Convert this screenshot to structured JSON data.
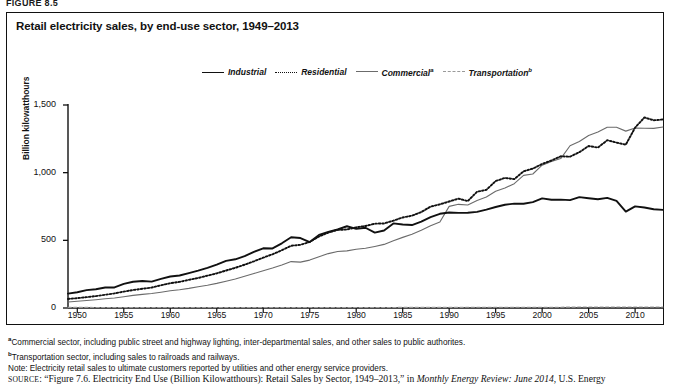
{
  "figure": {
    "number": "FIGURE 8.5",
    "title": "Retail electricity sales, by end-use sector, 1949–2013"
  },
  "axis": {
    "y_label": "Billion kilowatthours",
    "y_ticks": [
      "0",
      "500",
      "1,000",
      "1,500"
    ],
    "x_ticks": [
      "1950",
      "1955",
      "1960",
      "1965",
      "1970",
      "1975",
      "1980",
      "1985",
      "1990",
      "1995",
      "2000",
      "2005",
      "2010"
    ]
  },
  "legend": {
    "items": [
      {
        "label": "Industrial",
        "style": "solid-bold",
        "color": "#111111",
        "sup": ""
      },
      {
        "label": "Residential",
        "style": "dotted",
        "color": "#111111",
        "sup": ""
      },
      {
        "label": "Commercial",
        "style": "solid-thin",
        "color": "#6b6b6b",
        "sup": "a"
      },
      {
        "label": "Transportation",
        "style": "dashed",
        "color": "#9a9a9a",
        "sup": "b"
      }
    ]
  },
  "notes": {
    "footnote_a_marker": "a",
    "footnote_a": "Commercial sector, including public street and highway lighting, inter-departmental sales, and other sales to public authorites.",
    "footnote_b_marker": "b",
    "footnote_b": "Transportation sector, including sales to railroads and railways.",
    "note": "Note: Electricity retail sales to ultimate customers reported by utilities and other energy service providers."
  },
  "source": {
    "prefix": "SOURCE",
    "text_1": ": “Figure 7.6. Electricity End Use (Billion Kilowatthours): Retail Sales by Sector, 1949–2013,” in ",
    "italic": "Monthly Energy Review: June 2014",
    "text_2": ", U.S. Energy"
  },
  "chart_data": {
    "type": "line",
    "title": "Retail electricity sales, by end-use sector, 1949–2013",
    "xlabel": "",
    "ylabel": "Billion kilowatthours",
    "xlim": [
      1949,
      2013
    ],
    "ylim": [
      0,
      1500
    ],
    "grid": false,
    "legend_position": "top-center",
    "x": [
      1949,
      1950,
      1951,
      1952,
      1953,
      1954,
      1955,
      1956,
      1957,
      1958,
      1959,
      1960,
      1961,
      1962,
      1963,
      1964,
      1965,
      1966,
      1967,
      1968,
      1969,
      1970,
      1971,
      1972,
      1973,
      1974,
      1975,
      1976,
      1977,
      1978,
      1979,
      1980,
      1981,
      1982,
      1983,
      1984,
      1985,
      1986,
      1987,
      1988,
      1989,
      1990,
      1991,
      1992,
      1993,
      1994,
      1995,
      1996,
      1997,
      1998,
      1999,
      2000,
      2001,
      2002,
      2003,
      2004,
      2005,
      2006,
      2007,
      2008,
      2009,
      2010,
      2011,
      2012,
      2013
    ],
    "series": [
      {
        "name": "Industrial",
        "style": "solid-bold",
        "color": "#111111",
        "values": [
          106,
          116,
          132,
          139,
          151,
          152,
          178,
          194,
          200,
          195,
          215,
          233,
          240,
          258,
          276,
          297,
          320,
          348,
          360,
          383,
          415,
          441,
          440,
          478,
          523,
          517,
          487,
          540,
          562,
          580,
          604,
          585,
          593,
          557,
          573,
          625,
          617,
          613,
          638,
          672,
          696,
          706,
          703,
          704,
          710,
          727,
          746,
          763,
          771,
          770,
          782,
          810,
          800,
          801,
          797,
          819,
          811,
          804,
          814,
          792,
          712,
          751,
          743,
          730,
          725
        ]
      },
      {
        "name": "Residential",
        "style": "dotted",
        "color": "#111111",
        "values": [
          67,
          73,
          80,
          88,
          98,
          108,
          121,
          133,
          142,
          151,
          168,
          183,
          193,
          208,
          222,
          239,
          256,
          277,
          297,
          320,
          345,
          372,
          397,
          427,
          460,
          467,
          488,
          528,
          557,
          577,
          580,
          596,
          606,
          623,
          625,
          645,
          669,
          682,
          709,
          749,
          766,
          787,
          808,
          790,
          859,
          873,
          938,
          961,
          952,
          1010,
          1030,
          1064,
          1090,
          1121,
          1118,
          1151,
          1197,
          1185,
          1240,
          1222,
          1207,
          1333,
          1408,
          1387,
          1393
        ]
      },
      {
        "name": "Commercial",
        "style": "solid-thin",
        "color": "#6b6b6b",
        "values": [
          44,
          50,
          55,
          61,
          68,
          74,
          83,
          93,
          101,
          107,
          117,
          128,
          135,
          145,
          157,
          168,
          182,
          198,
          214,
          234,
          255,
          275,
          295,
          318,
          343,
          339,
          354,
          379,
          402,
          417,
          422,
          434,
          441,
          455,
          470,
          497,
          522,
          545,
          574,
          608,
          635,
          751,
          766,
          761,
          795,
          820,
          863,
          886,
          919,
          980,
          990,
          1055,
          1083,
          1104,
          1199,
          1230,
          1275,
          1300,
          1336,
          1336,
          1307,
          1330,
          1328,
          1327,
          1337
        ]
      },
      {
        "name": "Transportation",
        "style": "dashed",
        "color": "#9a9a9a",
        "values": [
          4.5,
          4.3,
          4.3,
          4.2,
          4.1,
          4.0,
          4.0,
          4.0,
          3.9,
          3.8,
          3.8,
          3.8,
          3.8,
          3.8,
          3.8,
          3.8,
          3.8,
          3.8,
          3.8,
          3.8,
          3.8,
          3.9,
          3.9,
          3.9,
          3.9,
          3.9,
          3.9,
          4.0,
          4.0,
          4.0,
          4.0,
          4.0,
          4.1,
          4.1,
          4.1,
          4.2,
          4.3,
          4.4,
          4.5,
          4.6,
          4.7,
          4.8,
          4.9,
          5.0,
          5.1,
          5.2,
          5.3,
          5.4,
          5.5,
          5.6,
          5.7,
          5.8,
          5.9,
          6.0,
          6.5,
          7.0,
          7.5,
          7.6,
          7.7,
          7.8,
          7.5,
          7.7,
          7.5,
          7.3,
          7.4
        ]
      }
    ]
  }
}
